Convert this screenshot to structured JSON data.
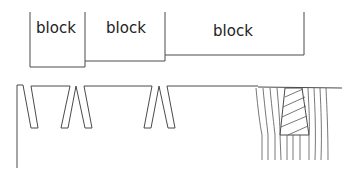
{
  "diagram": {
    "type": "welding-groove-sketch",
    "blocks": [
      {
        "label": "block"
      },
      {
        "label": "block"
      },
      {
        "label": "block"
      }
    ],
    "colors": {
      "line": "#4a4a4a",
      "text": "#222222",
      "background": "#ffffff"
    }
  }
}
